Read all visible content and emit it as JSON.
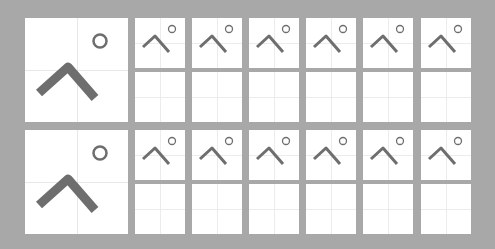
{
  "worksheet": {
    "character": "ぺ",
    "reading": "pe",
    "colors": {
      "background": "#a8a8a8",
      "cell": "#ffffff",
      "guide_line": "#e8e8e8",
      "stroke": "#6e6e6e"
    },
    "rows": [
      {
        "model_char": "ぺ",
        "practice_cells": 6
      },
      {
        "model_char": "ぺ",
        "practice_cells": 6
      }
    ]
  }
}
